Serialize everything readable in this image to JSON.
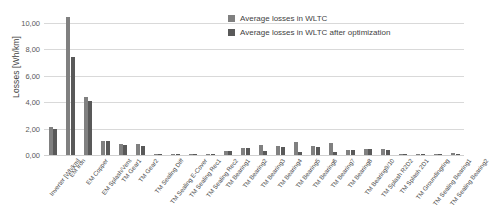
{
  "chart_data": {
    "type": "bar",
    "title": "",
    "xlabel": "",
    "ylabel": "Losses [Wh/km]",
    "ylim": [
      0,
      10.8
    ],
    "ytick_labels": [
      "0,00",
      "2,00",
      "4,00",
      "6,00",
      "8,00",
      "10,00"
    ],
    "ytick_values": [
      0,
      2,
      4,
      6,
      8,
      10
    ],
    "grid": true,
    "legend_position": "top-right",
    "decimal_separator": ",",
    "categories": [
      "Inverter [Wh/km]",
      "EM Iron",
      "EM Copper",
      "EM Splash/Vent",
      "TM Gear1",
      "TM Gear2",
      "TM Sealing Diff",
      "TM Sealing E-Cover",
      "TM Sealing Rec1",
      "TM Sealing Rec2",
      "TM Bearing1",
      "TM Bearing2",
      "TM Bearing3",
      "TM Bearing4",
      "TM Bearing5",
      "TM Bearing6",
      "TM Bearing7",
      "TM Bearing8",
      "TM Bearing9/10",
      "TM Splash R2D2",
      "TM Splash 2D1",
      "TM Groundingring",
      "TM Sealing Bearing1",
      "TM Sealing Bearing2"
    ],
    "series": [
      {
        "name": "Average losses in WLTC",
        "color": "#808080",
        "values": [
          2.1,
          10.4,
          4.4,
          1.05,
          0.8,
          0.85,
          0.1,
          0.1,
          0.04,
          0.03,
          0.3,
          0.55,
          0.72,
          0.7,
          0.95,
          0.7,
          0.88,
          0.4,
          0.45,
          0.42,
          0.02,
          0.02,
          0.02,
          0.12
        ]
      },
      {
        "name": "Average losses in WLTC after optimization",
        "color": "#595959",
        "values": [
          2.0,
          7.4,
          4.1,
          1.05,
          0.78,
          0.7,
          0.1,
          0.1,
          0.04,
          0.03,
          0.28,
          0.52,
          0.32,
          0.6,
          0.25,
          0.6,
          0.25,
          0.35,
          0.42,
          0.38,
          0.02,
          0.02,
          0.02,
          0.1
        ]
      }
    ]
  },
  "legend": {
    "items": [
      {
        "label": "Average losses in WLTC"
      },
      {
        "label": "Average losses in WLTC after optimization"
      }
    ]
  }
}
